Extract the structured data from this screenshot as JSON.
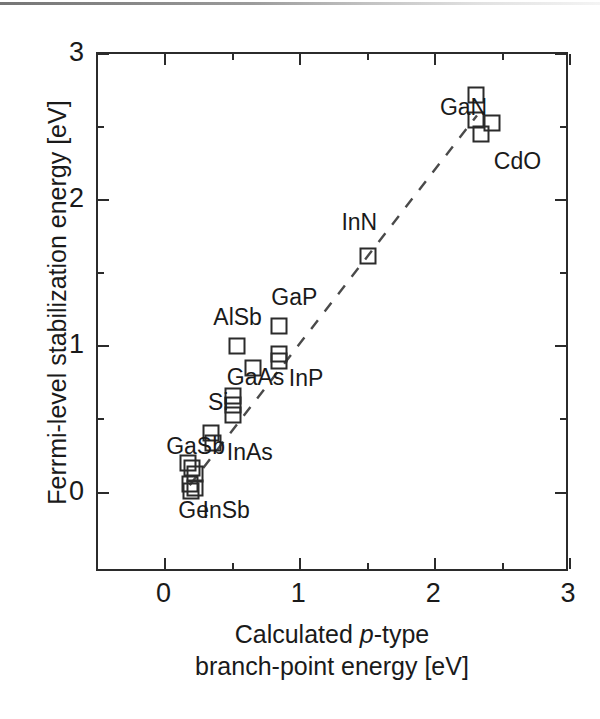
{
  "chart_data": {
    "type": "scatter",
    "title": "",
    "xlabel": "Calculated p-type branch-point energy [eV]",
    "ylabel": "Ferrmi-level stabilization energy [eV]",
    "xlabel_line1_pre": "Calculated ",
    "xlabel_line1_ital": "p",
    "xlabel_line1_post": "-type",
    "xlabel_line2": "branch-point energy [eV]",
    "xlim": [
      -0.5,
      3.0
    ],
    "ylim": [
      -0.55,
      3.0
    ],
    "grid": false,
    "legend": "none",
    "marker_style": "open-square",
    "xticks_major": [
      0,
      1,
      2,
      3
    ],
    "xticks_major_labels": [
      "0",
      "1",
      "2",
      "3"
    ],
    "xticks_minor": [
      0.5,
      1.5,
      2.5
    ],
    "yticks_major": [
      0,
      1,
      2,
      3
    ],
    "yticks_major_labels": [
      "0",
      "1",
      "2",
      "3"
    ],
    "yticks_minor": [
      0.5,
      1.5,
      2.5
    ],
    "points": [
      {
        "x": 0.17,
        "y": 0.2,
        "material": "GaSb"
      },
      {
        "x": 0.2,
        "y": 0.17,
        "material": "GaSb"
      },
      {
        "x": 0.22,
        "y": 0.13,
        "material": "InSb"
      },
      {
        "x": 0.18,
        "y": 0.06,
        "material": "Ge"
      },
      {
        "x": 0.22,
        "y": 0.03,
        "material": "InSb"
      },
      {
        "x": 0.19,
        "y": 0.01,
        "material": "Ge"
      },
      {
        "x": 0.34,
        "y": 0.41,
        "material": "InAs"
      },
      {
        "x": 0.35,
        "y": 0.34,
        "material": "InAs"
      },
      {
        "x": 0.5,
        "y": 0.66,
        "material": "Si"
      },
      {
        "x": 0.5,
        "y": 0.6,
        "material": "Si"
      },
      {
        "x": 0.5,
        "y": 0.53,
        "material": "GaAs"
      },
      {
        "x": 0.53,
        "y": 1.0,
        "material": "AlSb"
      },
      {
        "x": 0.65,
        "y": 0.85,
        "material": "GaAs"
      },
      {
        "x": 0.84,
        "y": 1.14,
        "material": "GaP"
      },
      {
        "x": 0.84,
        "y": 0.95,
        "material": "InP"
      },
      {
        "x": 0.84,
        "y": 0.9,
        "material": "InP"
      },
      {
        "x": 1.5,
        "y": 1.62,
        "material": "InN"
      },
      {
        "x": 2.3,
        "y": 2.72,
        "material": "GaN"
      },
      {
        "x": 2.3,
        "y": 2.55,
        "material": "GaN"
      },
      {
        "x": 2.42,
        "y": 2.53,
        "material": "CdO"
      },
      {
        "x": 2.34,
        "y": 2.45,
        "material": "CdO"
      }
    ],
    "annotations": [
      {
        "text": "GaN",
        "x": 2.05,
        "y": 2.62
      },
      {
        "text": "CdO",
        "x": 2.45,
        "y": 2.25
      },
      {
        "text": "InN",
        "x": 1.32,
        "y": 1.83
      },
      {
        "text": "GaP",
        "x": 0.8,
        "y": 1.32
      },
      {
        "text": "AlSb",
        "x": 0.37,
        "y": 1.18
      },
      {
        "text": "InP",
        "x": 0.93,
        "y": 0.76
      },
      {
        "text": "GaAs",
        "x": 0.47,
        "y": 0.77
      },
      {
        "text": "Si",
        "x": 0.33,
        "y": 0.6
      },
      {
        "text": "GaSb",
        "x": 0.02,
        "y": 0.3
      },
      {
        "text": "InAs",
        "x": 0.47,
        "y": 0.26
      },
      {
        "text": "Ge",
        "x": 0.11,
        "y": -0.14
      },
      {
        "text": "InSb",
        "x": 0.29,
        "y": -0.14
      }
    ],
    "trend_line": {
      "style": "dashed",
      "x0": 0.18,
      "y0": 0.05,
      "x1": 2.31,
      "y1": 2.58
    }
  }
}
